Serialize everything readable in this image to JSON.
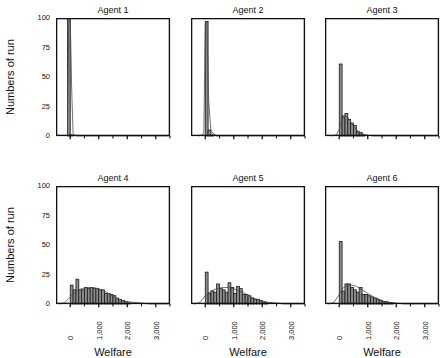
{
  "figure": {
    "type": "multi-panel-histogram",
    "rows": 2,
    "cols": 3,
    "yaxis_label": "Numbers of run",
    "xaxis_label": "Welfare",
    "ytick_labels": [
      "100",
      "75",
      "50",
      "25",
      "0"
    ],
    "ytick_values": [
      100,
      75,
      50,
      25,
      0
    ],
    "xtick_labels": [
      "0",
      "1,000",
      "2,000",
      "3,000"
    ],
    "xtick_values": [
      0,
      1000,
      2000,
      3000
    ],
    "bar_fill": "#8c8c8c",
    "bar_stroke": "#1a1a1a",
    "curve_color": "#4d4d4d",
    "axis_color": "#111111"
  },
  "chart_data": [
    {
      "type": "bar",
      "title": "Agent 1",
      "xlabel": "Welfare",
      "ylabel": "Numbers of run",
      "xlim": [
        -500,
        3500
      ],
      "ylim": [
        0,
        100
      ],
      "grid": false,
      "bin_width": 100,
      "bin_starts": [
        -100,
        0,
        100,
        200
      ],
      "values": [
        100,
        1,
        0,
        0
      ],
      "density_curve": [
        [
          -150,
          0
        ],
        [
          -100,
          1
        ],
        [
          -50,
          98
        ],
        [
          0,
          100
        ],
        [
          50,
          40
        ],
        [
          100,
          2
        ],
        [
          200,
          0
        ],
        [
          3500,
          0
        ]
      ]
    },
    {
      "type": "bar",
      "title": "Agent 2",
      "xlabel": "Welfare",
      "ylabel": "Numbers of run",
      "xlim": [
        -500,
        3500
      ],
      "ylim": [
        0,
        100
      ],
      "grid": false,
      "bin_width": 100,
      "bin_starts": [
        0,
        100,
        200,
        300
      ],
      "values": [
        97,
        5,
        1,
        0
      ],
      "density_curve": [
        [
          -200,
          0
        ],
        [
          -50,
          2
        ],
        [
          0,
          95
        ],
        [
          50,
          97
        ],
        [
          120,
          30
        ],
        [
          200,
          4
        ],
        [
          400,
          0
        ],
        [
          3500,
          0
        ]
      ]
    },
    {
      "type": "bar",
      "title": "Agent 3",
      "xlabel": "Welfare",
      "ylabel": "Numbers of run",
      "xlim": [
        -500,
        3500
      ],
      "ylim": [
        0,
        100
      ],
      "grid": false,
      "bin_width": 100,
      "bin_starts": [
        0,
        100,
        200,
        300,
        400,
        500,
        600,
        700,
        800
      ],
      "values": [
        61,
        17,
        19,
        14,
        11,
        9,
        4,
        3,
        1
      ],
      "density_curve": [
        [
          -300,
          0
        ],
        [
          -100,
          1
        ],
        [
          0,
          6
        ],
        [
          100,
          14
        ],
        [
          200,
          17
        ],
        [
          300,
          16
        ],
        [
          400,
          12
        ],
        [
          500,
          8
        ],
        [
          700,
          3
        ],
        [
          900,
          1
        ],
        [
          1200,
          0
        ],
        [
          3500,
          0
        ]
      ]
    },
    {
      "type": "bar",
      "title": "Agent 4",
      "xlabel": "Welfare",
      "ylabel": "Numbers of run",
      "xlim": [
        -500,
        3500
      ],
      "ylim": [
        0,
        100
      ],
      "grid": false,
      "bin_width": 100,
      "bin_starts": [
        0,
        100,
        200,
        300,
        400,
        500,
        600,
        700,
        800,
        900,
        1000,
        1100,
        1200,
        1300,
        1400,
        1500,
        1600,
        1700,
        1800,
        1900,
        2000
      ],
      "values": [
        16,
        12,
        21,
        12,
        12,
        14,
        13,
        14,
        13,
        13,
        12,
        12,
        9,
        9,
        8,
        7,
        5,
        4,
        3,
        2,
        1
      ],
      "density_curve": [
        [
          -400,
          0
        ],
        [
          -200,
          1
        ],
        [
          0,
          6
        ],
        [
          200,
          11
        ],
        [
          400,
          13
        ],
        [
          600,
          14
        ],
        [
          800,
          14
        ],
        [
          1000,
          13
        ],
        [
          1200,
          11
        ],
        [
          1400,
          8
        ],
        [
          1600,
          5
        ],
        [
          1800,
          3
        ],
        [
          2000,
          2
        ],
        [
          2400,
          1
        ],
        [
          2800,
          0
        ],
        [
          3500,
          0
        ]
      ]
    },
    {
      "type": "bar",
      "title": "Agent 5",
      "xlabel": "Welfare",
      "ylabel": "Numbers of run",
      "xlim": [
        -500,
        3500
      ],
      "ylim": [
        0,
        100
      ],
      "grid": false,
      "bin_width": 100,
      "bin_starts": [
        0,
        100,
        200,
        300,
        400,
        500,
        600,
        700,
        800,
        900,
        1000,
        1100,
        1200,
        1300,
        1400,
        1500,
        1600,
        1700,
        1800,
        1900,
        2000,
        2100
      ],
      "values": [
        27,
        9,
        11,
        10,
        17,
        13,
        12,
        10,
        18,
        14,
        9,
        15,
        13,
        8,
        8,
        7,
        5,
        4,
        4,
        3,
        2,
        1
      ],
      "density_curve": [
        [
          -400,
          0
        ],
        [
          -200,
          1
        ],
        [
          0,
          7
        ],
        [
          200,
          11
        ],
        [
          400,
          13
        ],
        [
          600,
          14
        ],
        [
          800,
          14
        ],
        [
          1000,
          13
        ],
        [
          1200,
          11
        ],
        [
          1400,
          9
        ],
        [
          1600,
          6
        ],
        [
          1800,
          4
        ],
        [
          2000,
          2
        ],
        [
          2400,
          1
        ],
        [
          2800,
          0
        ],
        [
          3500,
          0
        ]
      ]
    },
    {
      "type": "bar",
      "title": "Agent 6",
      "xlabel": "Welfare",
      "ylabel": "Numbers of run",
      "xlim": [
        -500,
        3500
      ],
      "ylim": [
        0,
        100
      ],
      "grid": false,
      "bin_width": 100,
      "bin_starts": [
        0,
        100,
        200,
        300,
        400,
        500,
        600,
        700,
        800,
        900,
        1000,
        1100,
        1200,
        1300,
        1400,
        1500,
        1600,
        1700,
        1800
      ],
      "values": [
        53,
        11,
        17,
        17,
        14,
        12,
        10,
        14,
        8,
        8,
        7,
        6,
        5,
        4,
        3,
        2,
        2,
        1,
        1
      ],
      "density_curve": [
        [
          -400,
          0
        ],
        [
          -200,
          1
        ],
        [
          0,
          8
        ],
        [
          150,
          14
        ],
        [
          300,
          16
        ],
        [
          450,
          16
        ],
        [
          600,
          15
        ],
        [
          800,
          12
        ],
        [
          1000,
          9
        ],
        [
          1200,
          6
        ],
        [
          1400,
          4
        ],
        [
          1600,
          2
        ],
        [
          1900,
          1
        ],
        [
          2300,
          0
        ],
        [
          3500,
          0
        ]
      ]
    }
  ]
}
